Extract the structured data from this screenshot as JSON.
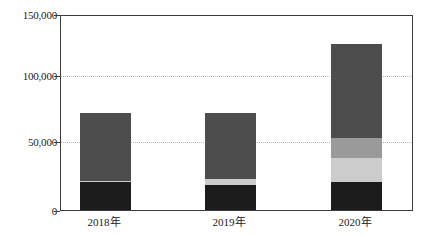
{
  "chart_data": {
    "type": "bar",
    "subtype": "stacked",
    "title": "",
    "xlabel": "",
    "ylabel": "",
    "categories": [
      "2018年",
      "2019年",
      "2020年"
    ],
    "ylim": [
      0,
      150000
    ],
    "yticks": [
      0,
      50000,
      100000,
      150000
    ],
    "ytick_labels": [
      "0",
      "50,000",
      "100,000",
      "150,000"
    ],
    "grid": true,
    "grid_axis": "y",
    "grid_style": "dotted",
    "legend": "none",
    "series": [
      {
        "name": "series-1",
        "color": "#1c1c1c",
        "values": [
          21500,
          19500,
          21500
        ]
      },
      {
        "name": "series-2",
        "color": "#cccccc",
        "values": [
          1000,
          4500,
          19000
        ]
      },
      {
        "name": "series-3",
        "color": "#9a9a9a",
        "values": [
          0,
          0,
          15000
        ]
      },
      {
        "name": "series-4",
        "color": "#4d4d4d",
        "values": [
          52500,
          51000,
          73000
        ]
      }
    ],
    "totals": [
      75000,
      75000,
      128500
    ]
  },
  "axis": {
    "y_labels": [
      {
        "value": 150000,
        "text": "150,000"
      },
      {
        "value": 100000,
        "text": "100,000"
      },
      {
        "value": 50000,
        "text": "50,000"
      },
      {
        "value": 0,
        "text": "0"
      }
    ],
    "x_labels": [
      {
        "text": "2018年"
      },
      {
        "text": "2019年"
      },
      {
        "text": "2020年"
      }
    ]
  },
  "colors": {
    "frame": "#3c3c3c",
    "grid": "#b9b9b9",
    "background": "#ffffff",
    "text": "#1a1a1a",
    "seg_dark": "#1c1c1c",
    "seg_light": "#cccccc",
    "seg_medium": "#9a9a9a",
    "seg_gray": "#4d4d4d"
  }
}
